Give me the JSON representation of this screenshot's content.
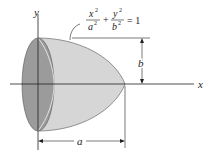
{
  "diagram": {
    "type": "solid of revolution",
    "axes": {
      "x_label": "x",
      "y_label": "y"
    },
    "equation": {
      "term1_num": "x",
      "term1_den": "a",
      "plus": "+",
      "term2_num": "y",
      "term2_den": "b",
      "exp": "2",
      "rhs": "= 1"
    },
    "dimensions": {
      "height_label": "b",
      "length_label": "a"
    },
    "colors": {
      "face": "#9b9b9b",
      "body": "#d6d6d6",
      "line": "#222222"
    }
  }
}
